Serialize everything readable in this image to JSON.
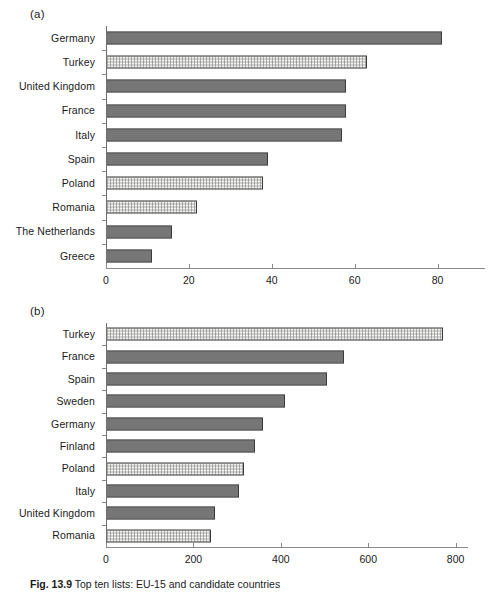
{
  "caption": {
    "figure_number": "Fig. 13.9",
    "text": "Top ten lists: EU-15 and candidate countries"
  },
  "panels": {
    "a": {
      "tag": "(a)"
    },
    "b": {
      "tag": "(b)"
    }
  },
  "colors": {
    "bar_dark_fill": "#a8a8a8",
    "bar_light_fill": "#f4f4f2",
    "bar_border": "#3a3a3a",
    "axis": "#8a8a8a",
    "text": "#1a1a1a"
  },
  "chart_data": [
    {
      "id": "panel-a",
      "type": "bar",
      "orientation": "horizontal",
      "title": "(a)",
      "xlabel": "",
      "ylabel": "",
      "xlim": [
        0,
        90
      ],
      "xticks": [
        0,
        20,
        40,
        60,
        80
      ],
      "xtick_labels": [
        "0",
        "20",
        "40",
        "60",
        "80"
      ],
      "grid": false,
      "legend": null,
      "categories": [
        "Germany",
        "Turkey",
        "United Kingdom",
        "France",
        "Italy",
        "Spain",
        "Poland",
        "Romania",
        "The Netherlands",
        "Greece"
      ],
      "values": [
        81,
        63,
        58,
        58,
        57,
        39,
        38,
        22,
        16,
        11
      ],
      "pattern": [
        "dark",
        "light",
        "dark",
        "dark",
        "dark",
        "dark",
        "light",
        "light",
        "dark",
        "dark"
      ]
    },
    {
      "id": "panel-b",
      "type": "bar",
      "orientation": "horizontal",
      "title": "(b)",
      "xlabel": "",
      "ylabel": "",
      "xlim": [
        0,
        810
      ],
      "xticks": [
        0,
        200,
        400,
        600,
        800
      ],
      "xtick_labels": [
        "0",
        "200",
        "400",
        "600",
        "800"
      ],
      "grid": false,
      "legend": null,
      "categories": [
        "Turkey",
        "France",
        "Spain",
        "Sweden",
        "Germany",
        "Finland",
        "Poland",
        "Italy",
        "United Kingdom",
        "Romania"
      ],
      "values": [
        772,
        545,
        505,
        410,
        360,
        340,
        315,
        305,
        250,
        240
      ],
      "pattern": [
        "light",
        "dark",
        "dark",
        "dark",
        "dark",
        "dark",
        "light",
        "dark",
        "dark",
        "light"
      ]
    }
  ]
}
